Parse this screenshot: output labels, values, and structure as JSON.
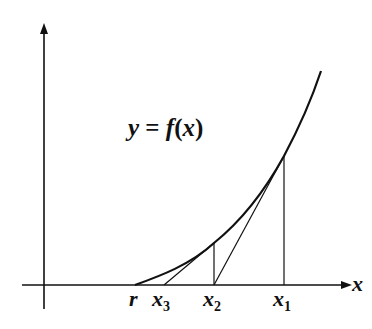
{
  "diagram": {
    "function_label": {
      "var": "y",
      "eq": "=",
      "fname": "f",
      "open": "(",
      "arg": "x",
      "close": ")"
    },
    "x_axis_label": "x",
    "points": [
      {
        "name": "r",
        "base": "r",
        "sub": ""
      },
      {
        "name": "x3",
        "base": "x",
        "sub": "3"
      },
      {
        "name": "x2",
        "base": "x",
        "sub": "2"
      },
      {
        "name": "x1",
        "base": "x",
        "sub": "1"
      }
    ],
    "colors": {
      "line": "#111111",
      "background": "#ffffff"
    }
  }
}
